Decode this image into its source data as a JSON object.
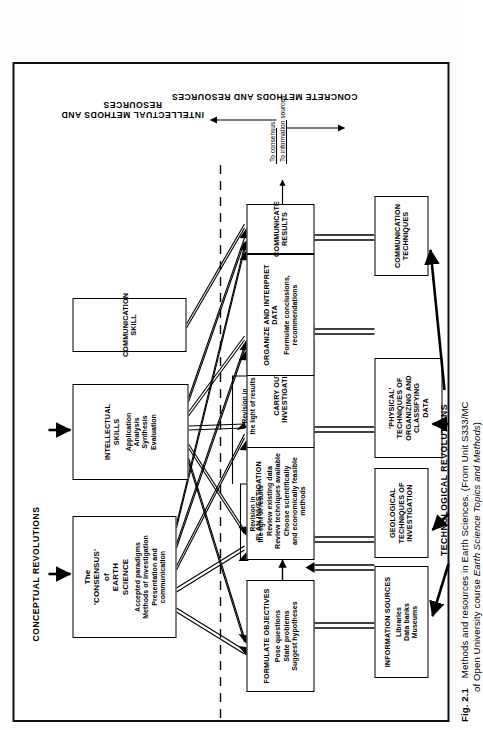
{
  "figure": {
    "number": "Fig. 2.1",
    "caption_main": "Methods and resources in Earth Sciences. (From Unit S333/MC",
    "caption_second_a": "of Open University course ",
    "caption_second_italic": "Earth Science Topics and Methods",
    "caption_second_b": ")"
  },
  "top_labels": {
    "conceptual_revolutions": "CONCEPTUAL REVOLUTIONS"
  },
  "bottom_labels": {
    "technological_revolutions": "TECHNOLOGICAL REVOLUTIONS"
  },
  "side_labels": {
    "intellectual": "INTELLECTUAL METHODS AND RESOURCES",
    "concrete": "CONCRETE METHODS AND RESOURCES"
  },
  "resource_boxes": [
    {
      "id": "consensus",
      "title_line1": "The",
      "title_line2": "'CONSENSUS'",
      "title_line3": "of",
      "title_line4": "EARTH",
      "title_line5": "SCIENCE",
      "body": [
        "Accepted paradigms",
        "Methods of investigation",
        "Presentation and",
        "communication"
      ]
    },
    {
      "id": "intellectual-skills",
      "title_line1": "INTELLECTUAL",
      "title_line2": "SKILLS",
      "body": [
        "Application",
        "Analysis",
        "Synthesis",
        "Evaluation"
      ]
    },
    {
      "id": "communication-skill",
      "title_line1": "COMMUNICATION",
      "title_line2": "SKILL",
      "body": []
    }
  ],
  "process_boxes": [
    {
      "id": "formulate-objectives",
      "title": "FORMULATE OBJECTIVES",
      "body": [
        "Pose questions",
        "State problems",
        "Suggest hypotheses"
      ]
    },
    {
      "id": "plan-investigation",
      "title": "PLAN INVESTIGATION",
      "body": [
        "Review existing data",
        "Review techniques available",
        "Choose scientifically",
        "and economically feasible",
        "methods"
      ]
    },
    {
      "id": "carry-out-investigation",
      "title": "CARRY OUT INVESTIGATION",
      "body": []
    },
    {
      "id": "organize-interpret-data",
      "title_line1": "ORGANIZE AND INTERPRET",
      "title_line2": "DATA",
      "body": [
        "Formulate conclusions,",
        "recommendations"
      ]
    },
    {
      "id": "communicate-results",
      "title": "COMMUNICATE RESULTS",
      "body": []
    }
  ],
  "concrete_boxes": [
    {
      "id": "information-sources",
      "title": "INFORMATION SOURCES",
      "body": [
        "Libraries",
        "Data banks",
        "Museums"
      ]
    },
    {
      "id": "geological-techniques",
      "title_lines": [
        "GEOLOGICAL",
        "TECHNIQUES OF",
        "INVESTIGATION"
      ]
    },
    {
      "id": "physical-techniques",
      "title_lines": [
        "'PHYSICAL'",
        "TECHNIQUES OF",
        "ORGANIZING AND",
        "CLASSIFYING",
        "DATA"
      ]
    },
    {
      "id": "communication-techniques",
      "title_lines": [
        "COMMUNICATION",
        "TECHNIQUES"
      ]
    }
  ],
  "revision_labels": [
    {
      "id": "revision-plan",
      "line1": "Revision in",
      "line2": "the light of results"
    },
    {
      "id": "revision-carry",
      "line1": "Revision in",
      "line2": "the light of results"
    }
  ],
  "output_labels": {
    "to_consensus": "To consensus",
    "to_information_sources": "To information sources"
  },
  "colors": {
    "ink": "#000000",
    "paper": "#ffffff"
  }
}
